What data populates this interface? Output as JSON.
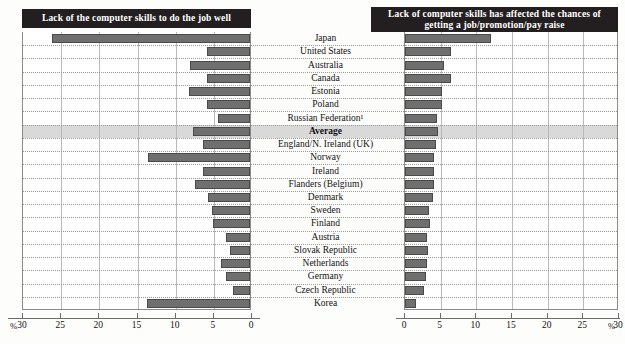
{
  "figure": {
    "panels": {
      "left": {
        "title": "Lack of the computer skills to do the job well",
        "axis_unit": "%",
        "ticks": [
          30,
          25,
          20,
          15,
          10,
          5,
          0
        ],
        "direction": "right-to-left"
      },
      "right": {
        "title": "Lack of computer skills has affected the chances of getting a job/promotion/pay raise",
        "axis_unit": "%",
        "ticks": [
          0,
          5,
          10,
          15,
          20,
          25,
          30
        ],
        "direction": "left-to-right"
      }
    }
  },
  "chart_data": {
    "type": "bar",
    "orientation": "horizontal-diverging",
    "xlabel": "%",
    "ylabel": "",
    "xlim": [
      0,
      30
    ],
    "grid": true,
    "legend_position": "none",
    "categories": [
      "Japan",
      "United States",
      "Australia",
      "Canada",
      "Estonia",
      "Poland",
      "Russian Federation¹",
      "Average",
      "England/N. Ireland (UK)",
      "Norway",
      "Ireland",
      "Flanders (Belgium)",
      "Denmark",
      "Sweden",
      "Finland",
      "Austria",
      "Slovak Republic",
      "Netherlands",
      "Germany",
      "Czech Republic",
      "Korea"
    ],
    "highlight_category": "Average",
    "series": [
      {
        "name": "Lack of the computer skills to do the job well",
        "panel": "left",
        "values": [
          26.0,
          5.6,
          7.8,
          5.6,
          8.0,
          5.6,
          4.2,
          7.5,
          6.2,
          13.3,
          6.2,
          7.2,
          5.5,
          5.0,
          4.9,
          3.2,
          2.6,
          3.8,
          3.2,
          2.2,
          13.5
        ]
      },
      {
        "name": "Lack of computer skills has affected the chances of getting a job/promotion/pay raise",
        "panel": "right",
        "values": [
          12.0,
          6.5,
          5.4,
          6.4,
          5.2,
          5.2,
          4.5,
          4.6,
          4.4,
          4.0,
          4.0,
          4.0,
          3.9,
          3.4,
          3.5,
          3.1,
          3.2,
          3.1,
          2.9,
          2.7,
          1.5
        ]
      }
    ]
  },
  "footnote_marker": "1"
}
